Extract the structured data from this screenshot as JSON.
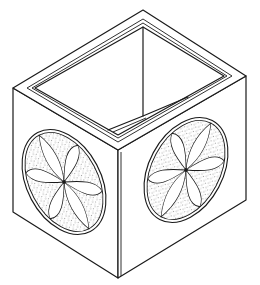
{
  "figure": {
    "colors": {
      "line": "#1a1a1a",
      "background": "#ffffff",
      "stipple": "#333333"
    },
    "elements": [
      "box-rim",
      "box-interior",
      "left-face",
      "right-face",
      "left-rosette",
      "right-rosette"
    ]
  }
}
